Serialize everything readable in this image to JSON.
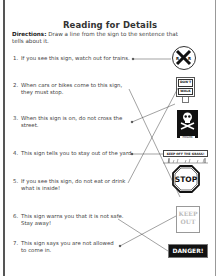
{
  "worksheet": {
    "title": "Reading for Details",
    "directions_label": "Directions:",
    "directions_text": " Draw a line from the sign to the sentence that tells about it."
  },
  "items": [
    {
      "number": "1.",
      "line1": "If you see this sign, watch out for trains.",
      "line2": ""
    },
    {
      "number": "2.",
      "line1": "When cars or bikes come to this sign,",
      "line2": "they must stop."
    },
    {
      "number": "3.",
      "line1": "When this sign is on, do not cross the",
      "line2": "street."
    },
    {
      "number": "4.",
      "line1": "This sign tells you to stay out of the yard.",
      "line2": ""
    },
    {
      "number": "5.",
      "line1": "If you see this sign, do not eat or drink",
      "line2": "what is inside!"
    },
    {
      "number": "6.",
      "line1": "This sign warns you that it is not safe.",
      "line2": "Stay away!"
    },
    {
      "number": "7.",
      "line1": "This sign says you are not allowed",
      "line2": "to come in."
    }
  ],
  "signs": {
    "railroad": {
      "left": "R",
      "right": "R"
    },
    "dont_walk": {
      "top": "DON'T",
      "bottom": "WALK"
    },
    "poison": {
      "label": "POISON"
    },
    "keep_off": {
      "label": "KEEP OFF THE GRASS!"
    },
    "stop": {
      "label": "STOP"
    },
    "keep_out": {
      "line1": "KEEP",
      "line2": "OUT"
    },
    "danger": {
      "label": "DANGER!"
    }
  },
  "colors": {
    "ink": "#222222",
    "text": "#444444",
    "sign_dark": "#111111"
  }
}
